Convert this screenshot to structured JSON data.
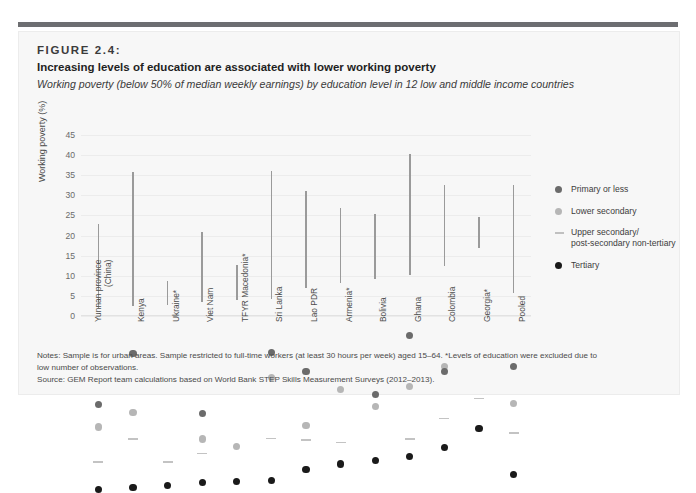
{
  "figure": {
    "number": "FIGURE 2.4:",
    "title": "Increasing levels of education are associated with lower working poverty",
    "subtitle": "Working poverty (below 50% of median weekly earnings) by education level in 12 low and middle income countries"
  },
  "legend": {
    "items": [
      {
        "label": "Primary or less",
        "marker": "dot",
        "color": "#6b6b6b"
      },
      {
        "label": "Lower secondary",
        "marker": "dot",
        "color": "#b6b6b6"
      },
      {
        "label": "Upper secondary/\npost-secondary non-tertiary",
        "line1": "Upper secondary/",
        "line2": "post-secondary non-tertiary",
        "marker": "dash",
        "color": "#c0c0c0"
      },
      {
        "label": "Tertiary",
        "marker": "dot",
        "color": "#1a1a1a"
      }
    ]
  },
  "notes": {
    "line1": "Notes: Sample is for urban areas. Sample restricted to full-time workers (at least 30 hours per week) aged 15–64. *Levels of education were excluded due to",
    "line2": "low number of observations.",
    "line3": "Source: GEM Report team calculations based on World Bank STEP Skills Measurement Surveys (2012–2013)."
  },
  "chart_data": {
    "type": "scatter",
    "title": "Increasing levels of education are associated with lower working poverty",
    "subtitle": "Working poverty (below 50% of median weekly earnings) by education level in 12 low and middle income countries",
    "xlabel": "",
    "ylabel": "Working poverty (%)",
    "ylim": [
      0,
      45
    ],
    "yticks": [
      0,
      5,
      10,
      15,
      20,
      25,
      30,
      35,
      40,
      45
    ],
    "grid": true,
    "legend_position": "right",
    "categories": [
      "Yunnan province (China)",
      "Kenya",
      "Ukraine*",
      "Viet Nam",
      "TFYR Macedonia*",
      "Sri Lanka",
      "Lao PDR",
      "Armenia*",
      "Bolivia",
      "Ghana",
      "Colombia",
      "Georgia*",
      "Pooled"
    ],
    "categories_multiline": [
      [
        "Yunnan province",
        "(China)"
      ],
      [
        "Kenya"
      ],
      [
        "Ukraine*"
      ],
      [
        "Viet Nam"
      ],
      [
        "TFYR Macedonia*"
      ],
      [
        "Sri Lanka"
      ],
      [
        "Lao PDR"
      ],
      [
        "Armenia*"
      ],
      [
        "Bolivia"
      ],
      [
        "Ghana"
      ],
      [
        "Colombia"
      ],
      [
        "Georgia*"
      ],
      [
        "Pooled"
      ]
    ],
    "series": [
      {
        "name": "Primary or less",
        "color": "#6b6b6b",
        "values": [
          23.0,
          35.7,
          null,
          20.8,
          null,
          36.0,
          31.2,
          null,
          25.4,
          40.2,
          31.3,
          null,
          32.5
        ]
      },
      {
        "name": "Lower secondary",
        "color": "#b6b6b6",
        "values": [
          17.4,
          21.0,
          null,
          14.4,
          12.6,
          29.8,
          17.7,
          26.8,
          22.5,
          27.5,
          32.5,
          null,
          23.3
        ]
      },
      {
        "name": "Upper secondary/post-secondary non-tertiary",
        "color": "#c0c0c0",
        "values": [
          8.7,
          14.4,
          8.7,
          10.8,
          null,
          14.5,
          14.2,
          13.5,
          null,
          14.4,
          19.5,
          24.5,
          15.9
        ]
      },
      {
        "name": "Tertiary",
        "color": "#1a1a1a",
        "values": [
          1.9,
          2.4,
          2.8,
          3.6,
          3.9,
          4.2,
          6.9,
          8.2,
          9.1,
          10.1,
          12.4,
          17.0,
          5.6
        ]
      }
    ]
  }
}
